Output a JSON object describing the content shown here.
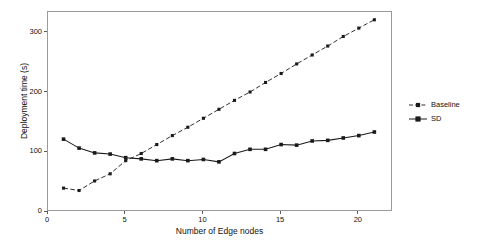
{
  "chart_data": {
    "type": "line",
    "title": "",
    "xlabel": "Number of Edge nodes",
    "ylabel": "Deployment time (s)",
    "xlim": [
      0,
      22.2
    ],
    "ylim": [
      0,
      335
    ],
    "xticks": [
      0,
      5,
      10,
      15,
      20
    ],
    "yticks": [
      0,
      100,
      200,
      300
    ],
    "ytick_labels": [
      "0",
      "100",
      "200",
      "300"
    ],
    "xtick_labels": [
      "0",
      "5",
      "10",
      "15",
      "20"
    ],
    "grid": false,
    "legend_position": "right",
    "x": [
      1,
      2,
      3,
      4,
      5,
      6,
      7,
      8,
      9,
      10,
      11,
      12,
      13,
      14,
      15,
      16,
      17,
      18,
      19,
      20,
      21
    ],
    "series": [
      {
        "name": "Baseline",
        "style": "dashed",
        "marker": "square",
        "color": "#1a1a1a",
        "values": [
          40,
          36,
          52,
          64,
          86,
          98,
          113,
          128,
          142,
          157,
          172,
          187,
          201,
          217,
          232,
          248,
          263,
          278,
          294,
          308,
          322
        ]
      },
      {
        "name": "SD",
        "style": "solid",
        "marker": "square",
        "color": "#1a1a1a",
        "values": [
          122,
          107,
          99,
          97,
          91,
          89,
          86,
          89,
          86,
          88,
          84,
          98,
          105,
          105,
          113,
          112,
          119,
          120,
          124,
          128,
          134
        ]
      }
    ]
  },
  "legend": {
    "items": [
      {
        "label": "Baseline"
      },
      {
        "label": "SD"
      }
    ]
  },
  "axes": {
    "x_title": "Number of Edge nodes",
    "y_title": "Deployment time (s)"
  }
}
